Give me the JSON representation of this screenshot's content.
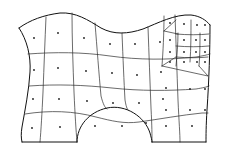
{
  "figure": {
    "title": "Quadrilateral finite-element mesh on a curved domain",
    "kind": "mesh-diagram",
    "width": 226,
    "height": 156,
    "background_color": "#ffffff",
    "edge_color": "#2b2b2b",
    "boundary_color": "#111111",
    "node_dot_color": "#1a1a1a",
    "edge_width": 0.7,
    "boundary_width": 1.0,
    "node_dot_radius": 0.9
  },
  "domain_outline": {
    "name": "outer-boundary",
    "description": "Closed region: wavy top edge, concave left edge, nearly straight right edge, flat bottom interrupted by a semicircular arch notch",
    "path": "M 22 140 L 18 131 L 23 118 L 27 102 L 29 86 L 30 70 L 28 54 L 24 38 L 19 28 L 30 24 L 45 17 L 61 13 L 76 14 L 89 20 L 102 28 L 116 33 L 131 32 L 146 27 L 160 20 L 175 15 L 190 15 L 203 19 L 210 25 L 210 40 L 210 58 L 209 76 L 208 94 L 207 112 L 206 130 L 206 142 L 152 142 L 152 139 L 148 126 L 139 116 L 127 110 L 113 108 L 99 111 L 88 118 L 80 129 L 77 140 L 77 142 L 22 142 Z"
  },
  "boundary_segments": [
    {
      "name": "top-wavy-edge",
      "shape": "sinusoidal",
      "path": "M 19 28 C 30 20 44 15 60 13 C 76 12 88 20 101 28 C 114 35 128 34 143 29 C 158 23 175 14 191 15 C 200 16 206 20 210 25"
    },
    {
      "name": "left-concave-edge",
      "shape": "concave-inward",
      "path": "M 19 28 C 27 40 31 56 30 72 C 29 90 25 110 22 127 C 21 133 21 138 22 142"
    },
    {
      "name": "right-edge",
      "shape": "near-straight",
      "path": "M 210 25 C 210 50 209 80 207 110 C 206 126 206 136 206 142"
    },
    {
      "name": "bottom-left-edge",
      "shape": "straight",
      "path": "M 22 142 L 77 142"
    },
    {
      "name": "bottom-right-edge",
      "shape": "straight",
      "path": "M 152 142 L 206 142"
    },
    {
      "name": "bottom-arch-notch",
      "shape": "semicircular-cut",
      "path": "M 77 142 C 77 126 89 112 107 108 C 126 104 145 117 150 133 C 151 137 152 140 152 142"
    }
  ],
  "grid_lines": {
    "horizontal": [
      {
        "name": "row-line-1",
        "path": "M 28 54 C 55 52 82 52 110 56 C 138 60 168 60 196 57 C 202 56 207 55 210 54"
      },
      {
        "name": "row-line-2",
        "path": "M 29 86 C 57 84 84 85 112 88 C 140 91 168 91 196 89 C 202 88 207 87 209 86"
      },
      {
        "name": "row-line-3",
        "path": "M 25 114 C 50 110 74 111 96 117 C 112 121 124 124 139 122 C 160 119 182 115 202 113 C 205 113 207 113 208 113"
      }
    ],
    "vertical": [
      {
        "name": "col-line-1",
        "path": "M 46 17 C 45 40 44 66 43 92 C 42 114 41 130 40 142"
      },
      {
        "name": "col-line-2",
        "path": "M 72 13 C 72 38 73 66 74 92 C 75 115 76 130 77 142"
      },
      {
        "name": "col-line-3",
        "path": "M 95 23 C 97 48 99 74 101 96 C 103 104 105 108 107 109"
      },
      {
        "name": "col-line-4",
        "path": "M 122 33 C 123 58 124 82 125 100 C 126 106 127 109 128 110"
      },
      {
        "name": "col-line-5",
        "path": "M 148 27 C 149 54 150 82 151 108 C 152 126 152 136 152 142"
      },
      {
        "name": "col-line-6",
        "path": "M 175 15 C 176 42 177 72 178 100 C 179 122 180 134 180 142"
      }
    ]
  },
  "refined_region": {
    "name": "locally-refined-subregion",
    "description": "Upper-right block subdivided into smaller quads with triangular/transition elements joining the coarse mesh",
    "bounds": {
      "x": 158,
      "y": 14,
      "width": 52,
      "height": 66
    },
    "edges": [
      {
        "name": "refine-outer-left",
        "path": "M 164 16 C 164 34 163 52 162 66"
      },
      {
        "name": "refine-transition-lower-left",
        "path": "M 162 66 L 176 57"
      },
      {
        "name": "refine-transition-to-corner",
        "path": "M 162 66 L 208 76"
      },
      {
        "name": "refine-transition-upper",
        "path": "M 164 31 L 178 34"
      },
      {
        "name": "refine-h-line-a",
        "path": "M 176 34 C 188 35 199 35 209 34"
      },
      {
        "name": "refine-h-line-b",
        "path": "M 176 46 C 188 47 199 47 209 46"
      },
      {
        "name": "refine-h-line-c",
        "path": "M 176 57 C 188 58 199 58 208 57"
      },
      {
        "name": "refine-v-line-a",
        "path": "M 178 33 C 178 44 177 56 176 66"
      },
      {
        "name": "refine-v-line-b",
        "path": "M 191 20 C 191 34 191 48 190 62"
      },
      {
        "name": "refine-v-line-c",
        "path": "M 200 33 C 200 44 200 55 199 66"
      },
      {
        "name": "refine-diag-top",
        "path": "M 164 31 L 176 20"
      },
      {
        "name": "refine-diag-corner",
        "path": "M 199 66 L 208 76"
      }
    ]
  },
  "element_centroid_dots": {
    "name": "element-centroid-markers",
    "count": 47,
    "points": [
      [
        34,
        38
      ],
      [
        58,
        33
      ],
      [
        84,
        38
      ],
      [
        110,
        44
      ],
      [
        135,
        44
      ],
      [
        160,
        42
      ],
      [
        34,
        70
      ],
      [
        58,
        68
      ],
      [
        86,
        71
      ],
      [
        112,
        73
      ],
      [
        137,
        75
      ],
      [
        161,
        72
      ],
      [
        33,
        99
      ],
      [
        59,
        99
      ],
      [
        87,
        101
      ],
      [
        113,
        103
      ],
      [
        139,
        103
      ],
      [
        163,
        99
      ],
      [
        32,
        128
      ],
      [
        60,
        127
      ],
      [
        95,
        126
      ],
      [
        122,
        126
      ],
      [
        146,
        123
      ],
      [
        166,
        126
      ],
      [
        192,
        126
      ],
      [
        170,
        23
      ],
      [
        184,
        24
      ],
      [
        197,
        25
      ],
      [
        170,
        40
      ],
      [
        184,
        40
      ],
      [
        196,
        40
      ],
      [
        205,
        40
      ],
      [
        170,
        52
      ],
      [
        184,
        52
      ],
      [
        196,
        52
      ],
      [
        205,
        52
      ],
      [
        170,
        62
      ],
      [
        184,
        62
      ],
      [
        197,
        62
      ],
      [
        190,
        89
      ],
      [
        190,
        110
      ],
      [
        166,
        88
      ],
      [
        166,
        110
      ],
      [
        205,
        25
      ],
      [
        205,
        62
      ],
      [
        205,
        89
      ],
      [
        205,
        110
      ]
    ]
  },
  "legend": {
    "visible": false,
    "items": []
  },
  "labels": {
    "visible": false,
    "items": []
  }
}
